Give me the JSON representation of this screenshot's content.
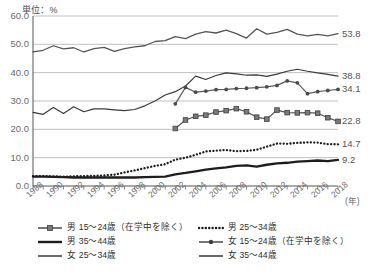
{
  "unit_label": "単位：%",
  "x_axis_unit": "(年)",
  "chart_data": {
    "type": "line",
    "title": "",
    "subtitle": "",
    "xlabel": "(年)",
    "ylabel": "単位：%",
    "ylim": [
      0,
      60
    ],
    "ytick_labels": [
      "0.0",
      "10.0",
      "20.0",
      "30.0",
      "40.0",
      "50.0",
      "60.0"
    ],
    "ytick_values": [
      0,
      10,
      20,
      30,
      40,
      50,
      60
    ],
    "grid": true,
    "legend_position": "bottom",
    "x": [
      1988,
      1989,
      1990,
      1991,
      1992,
      1993,
      1994,
      1995,
      1996,
      1997,
      1998,
      1999,
      2000,
      2001,
      2002,
      2003,
      2004,
      2005,
      2006,
      2007,
      2008,
      2009,
      2010,
      2011,
      2012,
      2013,
      2014,
      2015,
      2016,
      2017,
      2018
    ],
    "xtick_labels": [
      "1988",
      "1990",
      "1992",
      "1994",
      "1996",
      "1998",
      "2000",
      "2002",
      "2004",
      "2006",
      "2008",
      "2010",
      "2012",
      "2014",
      "2016",
      "2018"
    ],
    "xlim": [
      1988,
      2018
    ],
    "series": [
      {
        "name": "男 15～24歳（在学中を除く）",
        "style": "line-square-marker",
        "color": "#555555",
        "end_value": 22.8,
        "start_year": 2002,
        "values": [
          null,
          null,
          null,
          null,
          null,
          null,
          null,
          null,
          null,
          null,
          null,
          null,
          null,
          null,
          20.3,
          23.3,
          24.6,
          25.0,
          26.1,
          26.6,
          27.3,
          26.2,
          24.3,
          23.6,
          26.8,
          25.9,
          25.8,
          25.9,
          25.7,
          24.1,
          22.8
        ]
      },
      {
        "name": "男 35～44歳",
        "style": "line-bold",
        "color": "#1d1d1d",
        "end_value": 9.2,
        "start_year": 1988,
        "values": [
          3.3,
          3.3,
          3.2,
          3.1,
          3.0,
          3.0,
          3.0,
          3.0,
          3.0,
          3.0,
          3.0,
          3.1,
          3.2,
          3.3,
          4.1,
          4.6,
          5.2,
          5.8,
          6.2,
          6.6,
          7.1,
          7.3,
          6.8,
          7.5,
          8.0,
          8.2,
          8.6,
          8.8,
          9.0,
          8.8,
          9.2
        ]
      },
      {
        "name": "女 25～34歳",
        "style": "line-thin",
        "color": "#3a3a3a",
        "end_value": 38.8,
        "start_year": 1988,
        "values": [
          26.0,
          25.3,
          27.7,
          25.6,
          28.0,
          26.2,
          27.2,
          27.2,
          26.9,
          26.6,
          27.0,
          28.3,
          30.0,
          32.1,
          33.3,
          35.3,
          38.8,
          37.6,
          39.0,
          39.9,
          39.6,
          39.1,
          39.2,
          38.7,
          39.5,
          40.5,
          41.2,
          40.5,
          39.9,
          39.4,
          38.8
        ]
      },
      {
        "name": "男 25～34歳",
        "style": "dotted",
        "color": "#1d1d1d",
        "end_value": 14.7,
        "start_year": 1988,
        "values": [
          3.5,
          3.5,
          3.4,
          3.3,
          3.4,
          3.5,
          3.6,
          3.7,
          4.0,
          4.8,
          5.5,
          6.3,
          7.1,
          7.7,
          9.3,
          10.0,
          11.0,
          12.2,
          12.5,
          12.7,
          12.3,
          12.4,
          12.8,
          13.9,
          15.0,
          14.9,
          15.2,
          15.4,
          15.3,
          14.8,
          14.7
        ]
      },
      {
        "name": "女 15～24歳（在学中を除く）",
        "style": "line-dot-marker",
        "color": "#5a5a5a",
        "end_value": 34.1,
        "start_year": 2002,
        "values": [
          null,
          null,
          null,
          null,
          null,
          null,
          null,
          null,
          null,
          null,
          null,
          null,
          null,
          null,
          29.0,
          34.8,
          33.1,
          33.5,
          34.0,
          34.1,
          34.4,
          34.5,
          34.7,
          35.0,
          35.5,
          37.1,
          36.4,
          32.6,
          33.3,
          33.7,
          34.1
        ]
      },
      {
        "name": "女 35～44歳",
        "style": "line-thin-gray",
        "color": "#555555",
        "end_value": 53.8,
        "start_year": 1988,
        "values": [
          47.3,
          47.9,
          49.5,
          48.4,
          48.8,
          47.3,
          48.5,
          48.9,
          47.5,
          48.5,
          49.1,
          49.5,
          51.0,
          51.3,
          52.7,
          52.0,
          53.6,
          54.5,
          54.0,
          55.0,
          53.8,
          52.2,
          55.5,
          53.6,
          54.2,
          55.3,
          53.6,
          53.0,
          53.5,
          53.0,
          53.8
        ]
      }
    ]
  },
  "legend": {
    "columns": [
      {
        "items": [
          {
            "label": "男 15～24歳（在学中を除く）",
            "style": "line-square-marker"
          },
          {
            "label": "男 35～44歳",
            "style": "line-bold"
          },
          {
            "label": "女 25～34歳",
            "style": "line-thin"
          }
        ]
      },
      {
        "items": [
          {
            "label": "男 25～34歳",
            "style": "dotted"
          },
          {
            "label": "女 15～24歳（在学中を除く）",
            "style": "line-dot-marker"
          },
          {
            "label": "女 35～44歳",
            "style": "line-thin-gray"
          }
        ]
      }
    ]
  }
}
